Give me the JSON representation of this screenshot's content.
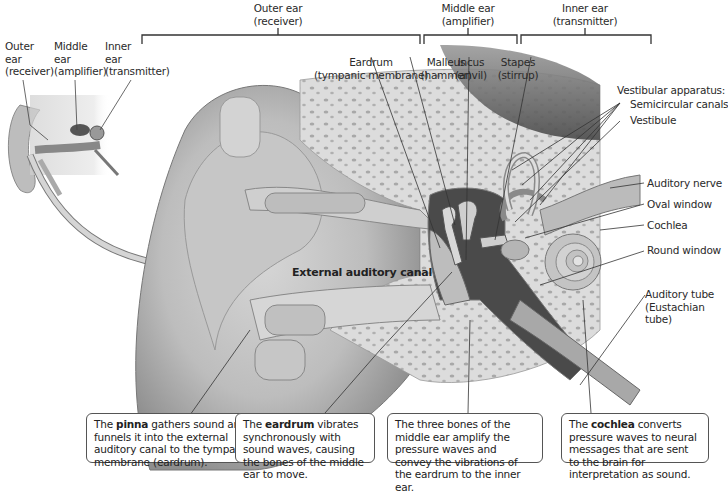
{
  "inset_labels": {
    "outer": {
      "line1": "Outer",
      "line2": "ear",
      "line3": "(receiver)"
    },
    "middle": {
      "line1": "Middle",
      "line2": "ear",
      "line3": "(amplifier)"
    },
    "inner": {
      "line1": "Inner",
      "line2": "ear",
      "line3": "(transmitter)"
    }
  },
  "section_headers": {
    "outer": {
      "title": "Outer ear",
      "role": "(receiver)"
    },
    "middle": {
      "title": "Middle ear",
      "role": "(amplifier)"
    },
    "inner": {
      "title": "Inner ear",
      "role": "(transmitter)"
    }
  },
  "structure_labels": {
    "eardrum": {
      "name": "Eardrum",
      "alt": "(tympanic membrane)"
    },
    "malleus": {
      "name": "Malleus",
      "alt": "(hammer)"
    },
    "incus": {
      "name": "Incus",
      "alt": "(anvil)"
    },
    "stapes": {
      "name": "Stapes",
      "alt": "(stirrup)"
    },
    "vestibular_apparatus": "Vestibular apparatus:",
    "semicircular_canals": "Semicircular canals",
    "vestibule": "Vestibule",
    "auditory_nerve": "Auditory nerve",
    "oval_window": "Oval window",
    "cochlea": "Cochlea",
    "round_window": "Round window",
    "auditory_tube": {
      "line1": "Auditory tube",
      "line2": "(Eustachian",
      "line3": "tube)"
    },
    "external_auditory_canal": "External auditory canal"
  },
  "callouts": [
    {
      "pre": "The ",
      "bold": "pinna",
      "post": " gathers sound and funnels it into the external auditory canal to the tympanic membrane (eardrum)."
    },
    {
      "pre": "The ",
      "bold": "eardrum",
      "post": " vibrates synchronously with sound waves, causing the bones of the middle ear to move."
    },
    {
      "pre": "",
      "bold": "",
      "post": "The three bones of the middle ear amplify the pressure waves and convey the vibrations of the eardrum to the inner ear."
    },
    {
      "pre": "The ",
      "bold": "cochlea",
      "post": " converts pressure waves to neural messages that are sent to the brain for interpretation as sound."
    }
  ]
}
